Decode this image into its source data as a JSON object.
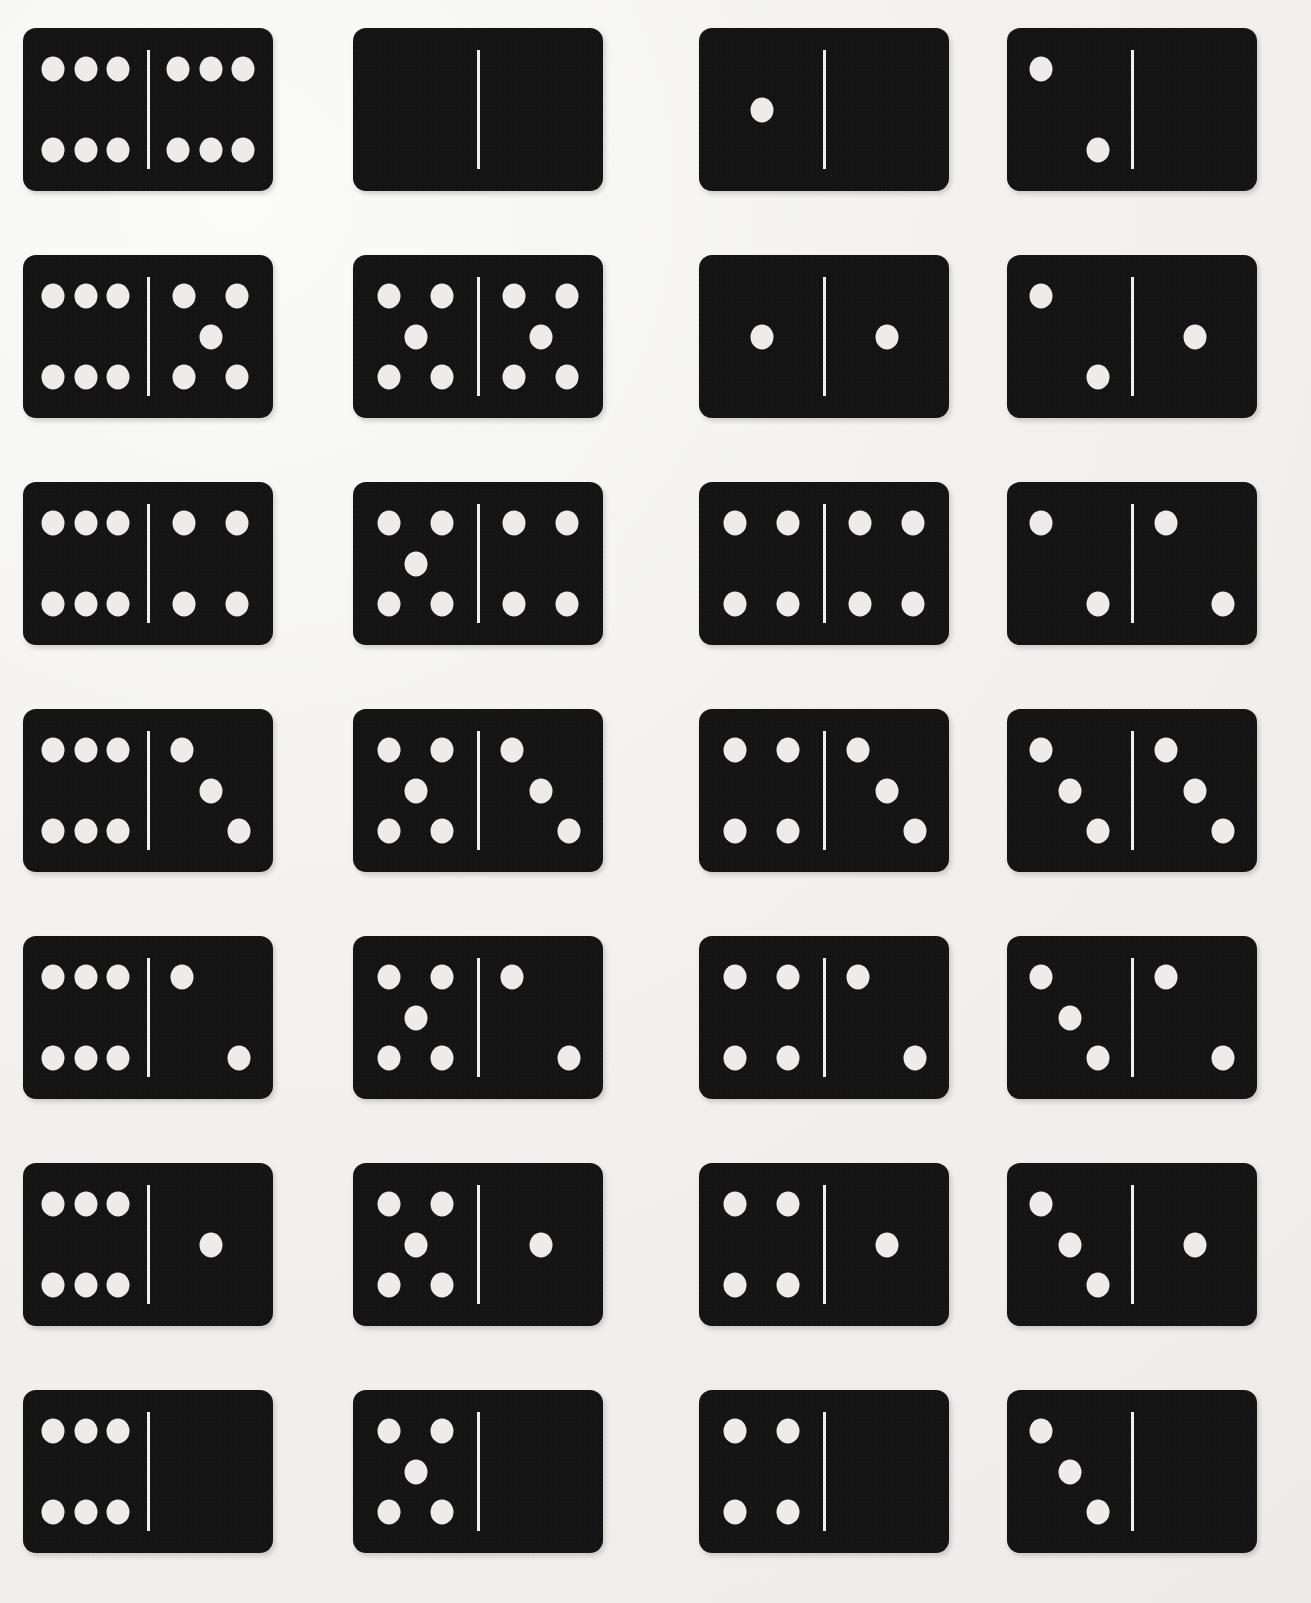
{
  "figure": {
    "kind": "domino-set-illustration",
    "tile_count": 28,
    "rows": 7,
    "columns": 4,
    "colors": {
      "tile": "#151414",
      "pip": "#edece8",
      "divider": "#f0efec",
      "background": "#f4f3f1"
    }
  },
  "chart_data": {
    "type": "table",
    "columns": [
      "column 1",
      "column 2",
      "column 3",
      "column 4"
    ],
    "rows": [
      [
        "6-6",
        "0-0",
        "1-0",
        "2-0"
      ],
      [
        "6-5",
        "5-5",
        "1-1",
        "2-1"
      ],
      [
        "6-4",
        "5-4",
        "4-4",
        "2-2"
      ],
      [
        "6-3",
        "5-3",
        "4-3",
        "3-3"
      ],
      [
        "6-2",
        "5-2",
        "4-2",
        "3-2"
      ],
      [
        "6-1",
        "5-1",
        "4-1",
        "3-1"
      ],
      [
        "6-0",
        "5-0",
        "4-0",
        "3-0"
      ]
    ]
  },
  "tiles": [
    {
      "id": "tile-6-6",
      "row": 1,
      "col": 1,
      "left": 6,
      "right": 6,
      "label": "6-6"
    },
    {
      "id": "tile-0-0",
      "row": 1,
      "col": 2,
      "left": 0,
      "right": 0,
      "label": "0-0"
    },
    {
      "id": "tile-1-0",
      "row": 1,
      "col": 3,
      "left": 1,
      "right": 0,
      "label": "1-0"
    },
    {
      "id": "tile-2-0",
      "row": 1,
      "col": 4,
      "left": 2,
      "right": 0,
      "label": "2-0"
    },
    {
      "id": "tile-6-5",
      "row": 2,
      "col": 1,
      "left": 6,
      "right": 5,
      "label": "6-5"
    },
    {
      "id": "tile-5-5",
      "row": 2,
      "col": 2,
      "left": 5,
      "right": 5,
      "label": "5-5"
    },
    {
      "id": "tile-1-1",
      "row": 2,
      "col": 3,
      "left": 1,
      "right": 1,
      "label": "1-1"
    },
    {
      "id": "tile-2-1",
      "row": 2,
      "col": 4,
      "left": 2,
      "right": 1,
      "label": "2-1"
    },
    {
      "id": "tile-6-4",
      "row": 3,
      "col": 1,
      "left": 6,
      "right": 4,
      "label": "6-4"
    },
    {
      "id": "tile-5-4",
      "row": 3,
      "col": 2,
      "left": 5,
      "right": 4,
      "label": "5-4"
    },
    {
      "id": "tile-4-4",
      "row": 3,
      "col": 3,
      "left": 4,
      "right": 4,
      "label": "4-4"
    },
    {
      "id": "tile-2-2",
      "row": 3,
      "col": 4,
      "left": 2,
      "right": 2,
      "label": "2-2"
    },
    {
      "id": "tile-6-3",
      "row": 4,
      "col": 1,
      "left": 6,
      "right": 3,
      "label": "6-3"
    },
    {
      "id": "tile-5-3",
      "row": 4,
      "col": 2,
      "left": 5,
      "right": 3,
      "label": "5-3"
    },
    {
      "id": "tile-4-3",
      "row": 4,
      "col": 3,
      "left": 4,
      "right": 3,
      "label": "4-3"
    },
    {
      "id": "tile-3-3",
      "row": 4,
      "col": 4,
      "left": 3,
      "right": 3,
      "label": "3-3"
    },
    {
      "id": "tile-6-2",
      "row": 5,
      "col": 1,
      "left": 6,
      "right": 2,
      "label": "6-2"
    },
    {
      "id": "tile-5-2",
      "row": 5,
      "col": 2,
      "left": 5,
      "right": 2,
      "label": "5-2"
    },
    {
      "id": "tile-4-2",
      "row": 5,
      "col": 3,
      "left": 4,
      "right": 2,
      "label": "4-2"
    },
    {
      "id": "tile-3-2",
      "row": 5,
      "col": 4,
      "left": 3,
      "right": 2,
      "label": "3-2"
    },
    {
      "id": "tile-6-1",
      "row": 6,
      "col": 1,
      "left": 6,
      "right": 1,
      "label": "6-1"
    },
    {
      "id": "tile-5-1",
      "row": 6,
      "col": 2,
      "left": 5,
      "right": 1,
      "label": "5-1"
    },
    {
      "id": "tile-4-1",
      "row": 6,
      "col": 3,
      "left": 4,
      "right": 1,
      "label": "4-1"
    },
    {
      "id": "tile-3-1",
      "row": 6,
      "col": 4,
      "left": 3,
      "right": 1,
      "label": "3-1"
    },
    {
      "id": "tile-6-0",
      "row": 7,
      "col": 1,
      "left": 6,
      "right": 0,
      "label": "6-0"
    },
    {
      "id": "tile-5-0",
      "row": 7,
      "col": 2,
      "left": 5,
      "right": 0,
      "label": "5-0"
    },
    {
      "id": "tile-4-0",
      "row": 7,
      "col": 3,
      "left": 4,
      "right": 0,
      "label": "4-0"
    },
    {
      "id": "tile-3-0",
      "row": 7,
      "col": 4,
      "left": 3,
      "right": 0,
      "label": "3-0"
    }
  ],
  "pip_layouts": {
    "0": [],
    "1": [
      [
        50,
        50
      ]
    ],
    "2": [
      [
        27,
        25
      ],
      [
        73,
        75
      ]
    ],
    "3": [
      [
        27,
        25
      ],
      [
        50,
        50
      ],
      [
        73,
        75
      ]
    ],
    "4": [
      [
        29,
        25
      ],
      [
        71,
        25
      ],
      [
        29,
        75
      ],
      [
        71,
        75
      ]
    ],
    "5": [
      [
        29,
        25
      ],
      [
        71,
        25
      ],
      [
        50,
        50
      ],
      [
        29,
        75
      ],
      [
        71,
        75
      ]
    ],
    "6": [
      [
        24,
        25
      ],
      [
        50,
        25
      ],
      [
        76,
        25
      ],
      [
        24,
        75
      ],
      [
        50,
        75
      ],
      [
        76,
        75
      ]
    ]
  }
}
